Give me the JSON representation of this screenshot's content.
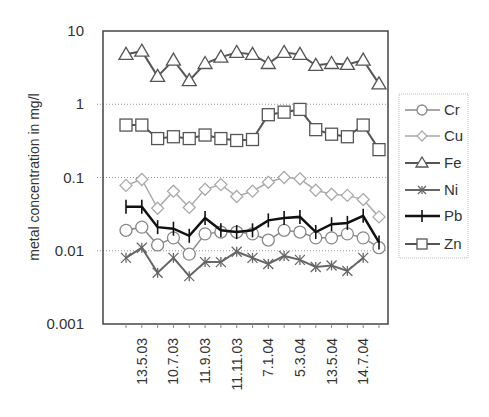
{
  "chart_data": {
    "type": "line",
    "title": "",
    "xlabel": "",
    "ylabel": "metal concentration in mg/l",
    "yscale": "log",
    "ylim": [
      0.001,
      10
    ],
    "yticks": [
      "10",
      "1",
      "0.1",
      "0.01",
      "0.001"
    ],
    "ytick_values": [
      10,
      1,
      0.1,
      0.01,
      0.001
    ],
    "grid": "horizontal dotted at each decade",
    "legend_position": "right",
    "n_points": 17,
    "x_tick_labels": [
      "13.5.03",
      "10.7.03",
      "11.9.03",
      "11.11.03",
      "7.1.04",
      "5.3.04",
      "13.5.04",
      "14.7.04"
    ],
    "x_tick_label_indices": [
      1,
      3,
      5,
      7,
      9,
      11,
      13,
      15
    ],
    "series": [
      {
        "name": "Cr",
        "marker": "circle",
        "color": "#888888",
        "line_width": 1.5,
        "values": [
          0.019,
          0.021,
          0.012,
          0.015,
          0.009,
          0.017,
          0.018,
          0.018,
          0.017,
          0.014,
          0.019,
          0.018,
          0.015,
          0.015,
          0.017,
          0.015,
          0.011
        ]
      },
      {
        "name": "Cu",
        "marker": "diamond",
        "color": "#aaaaaa",
        "line_width": 1.5,
        "values": [
          0.078,
          0.094,
          0.038,
          0.065,
          0.039,
          0.069,
          0.08,
          0.055,
          0.065,
          0.086,
          0.1,
          0.096,
          0.067,
          0.059,
          0.057,
          0.05,
          0.029
        ]
      },
      {
        "name": "Fe",
        "marker": "triangle",
        "color": "#555555",
        "line_width": 2,
        "values": [
          4.8,
          5.3,
          2.4,
          4.0,
          2.1,
          3.6,
          4.4,
          5.1,
          4.8,
          3.6,
          5.1,
          4.8,
          3.4,
          3.6,
          3.5,
          4.0,
          1.9
        ]
      },
      {
        "name": "Ni",
        "marker": "asterisk",
        "color": "#666666",
        "line_width": 2,
        "values": [
          0.008,
          0.011,
          0.005,
          0.008,
          0.0045,
          0.007,
          0.007,
          0.0097,
          0.008,
          0.0066,
          0.0085,
          0.0075,
          0.006,
          0.0063,
          0.0053,
          0.008,
          null
        ]
      },
      {
        "name": "Pb",
        "marker": "plus",
        "color": "#111111",
        "line_width": 2.5,
        "values": [
          0.04,
          0.04,
          0.021,
          0.02,
          0.016,
          0.028,
          0.019,
          0.018,
          0.019,
          0.026,
          0.028,
          0.029,
          0.018,
          0.023,
          0.024,
          0.03,
          0.013
        ]
      },
      {
        "name": "Zn",
        "marker": "square",
        "color": "#555555",
        "line_width": 2,
        "values": [
          0.52,
          0.52,
          0.34,
          0.36,
          0.34,
          0.38,
          0.34,
          0.32,
          0.33,
          0.72,
          0.78,
          0.85,
          0.45,
          0.39,
          0.36,
          0.52,
          0.24
        ]
      }
    ]
  }
}
